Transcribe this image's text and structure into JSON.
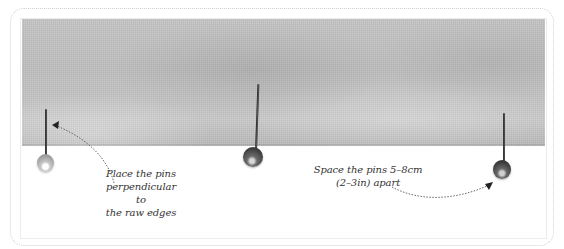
{
  "figure": {
    "colors": {
      "fabric": "#c2c2c2",
      "background": "#ffffff",
      "frame_border": "#cfcfcf",
      "annotation_text": "#333333",
      "pin_dark": "#2d2d2d",
      "pin_light": "#9d9d9d"
    },
    "pins": [
      {
        "id": "left",
        "head_color": "light-grey"
      },
      {
        "id": "center",
        "head_color": "dark-grey"
      },
      {
        "id": "right",
        "head_color": "dark-grey"
      }
    ],
    "annotations": {
      "left": {
        "lines": [
          "Place the pins",
          "perpendicular to",
          "the raw edges"
        ]
      },
      "right": {
        "lines": [
          "Space the pins 5–8cm",
          "(2–3in) apart"
        ]
      }
    }
  }
}
